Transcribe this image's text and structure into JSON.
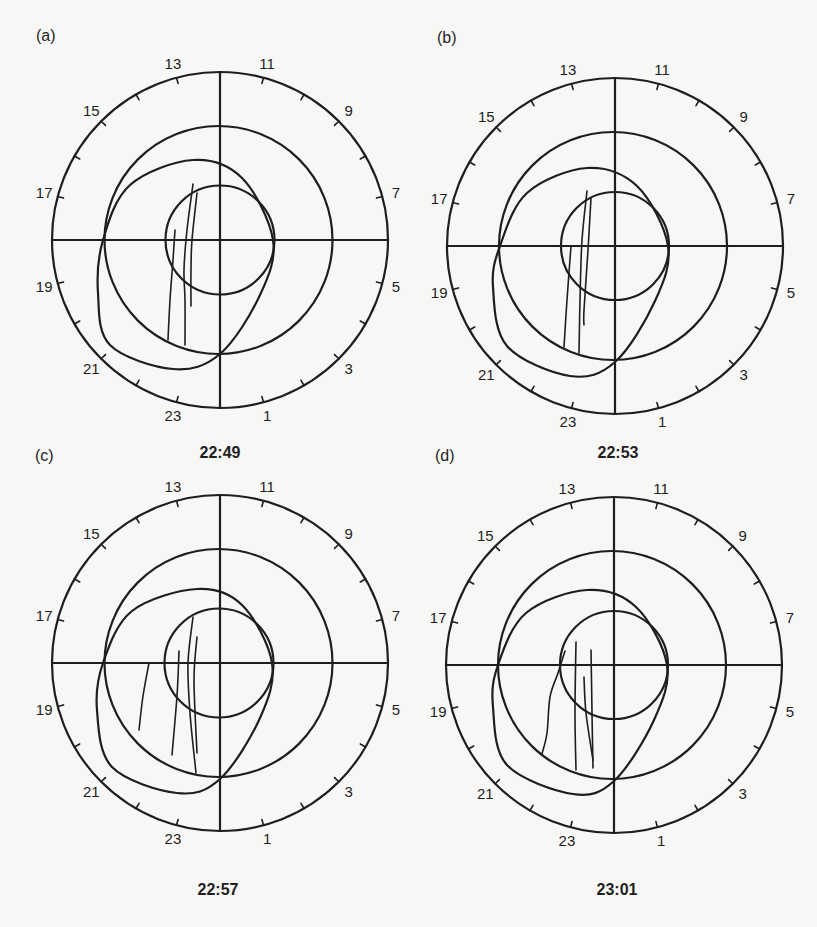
{
  "figure": {
    "hour_labels": [
      "1",
      "3",
      "5",
      "7",
      "9",
      "11",
      "13",
      "15",
      "17",
      "19",
      "21",
      "23"
    ],
    "hours_per_tick": 1,
    "top_hour": 12,
    "outer_radius": 168,
    "line_color": "#1e1e1e",
    "background_color": "#f7f7f5",
    "panels": [
      {
        "id": "a",
        "letter": "(a)",
        "time": "22:49",
        "center": [
          220,
          240
        ],
        "letter_pos": [
          36,
          41
        ],
        "time_pos": [
          220,
          458
        ],
        "middle_circle": {
          "cx": -1.5,
          "cy": 0,
          "r": 114
        },
        "inner_circle": {
          "cx": 0,
          "cy": 0,
          "r": 54.5
        },
        "oval": [
          [
            -117,
            0
          ],
          [
            -90,
            -55
          ],
          [
            -27,
            -80
          ],
          [
            22,
            -62
          ],
          [
            53,
            0
          ],
          [
            40,
            55
          ],
          [
            0,
            114
          ],
          [
            -47,
            129
          ],
          [
            -110,
            105
          ],
          [
            -122,
            53
          ]
        ],
        "arcs": [
          [
            [
              -45,
              -10
            ],
            [
              -47,
              20
            ],
            [
              -50,
              60
            ],
            [
              -52,
              100
            ]
          ],
          [
            [
              -27,
              -56
            ],
            [
              -33,
              -10
            ],
            [
              -36,
              30
            ],
            [
              -35,
              60
            ],
            [
              -35,
              105
            ]
          ],
          [
            [
              -23,
              -47
            ],
            [
              -28,
              0
            ],
            [
              -29,
              30
            ],
            [
              -29,
              66
            ]
          ]
        ]
      },
      {
        "id": "b",
        "letter": "(b)",
        "time": "22:53",
        "center": [
          615,
          246
        ],
        "letter_pos": [
          437,
          43
        ],
        "time_pos": [
          618,
          458
        ],
        "middle_circle": {
          "cx": -2,
          "cy": 0,
          "r": 114
        },
        "inner_circle": {
          "cx": 0,
          "cy": 0,
          "r": 54
        },
        "oval": [
          [
            -115,
            0
          ],
          [
            -88,
            -53
          ],
          [
            -28,
            -78
          ],
          [
            22,
            -60
          ],
          [
            53,
            0
          ],
          [
            40,
            55
          ],
          [
            0,
            116
          ],
          [
            -45,
            130
          ],
          [
            -108,
            100
          ],
          [
            -122,
            41
          ]
        ],
        "arcs": [
          [
            [
              -44,
              0
            ],
            [
              -48,
              54
            ],
            [
              -51,
              101
            ]
          ],
          [
            [
              -28,
              -55
            ],
            [
              -33,
              -6
            ],
            [
              -35,
              54
            ],
            [
              -36,
              107
            ]
          ],
          [
            [
              -24,
              -48
            ],
            [
              -27,
              4
            ],
            [
              -31,
              64
            ],
            [
              -31,
              79
            ]
          ]
        ]
      },
      {
        "id": "c",
        "letter": "(c)",
        "time": "22:57",
        "center": [
          220,
          663
        ],
        "letter_pos": [
          35,
          461
        ],
        "time_pos": [
          218,
          895
        ],
        "middle_circle": {
          "cx": -1.5,
          "cy": 0,
          "r": 114
        },
        "inner_circle": {
          "cx": -1,
          "cy": 0,
          "r": 54.5
        },
        "oval": [
          [
            -117,
            0
          ],
          [
            -88,
            -52
          ],
          [
            -23,
            -74
          ],
          [
            22,
            -58
          ],
          [
            52,
            0
          ],
          [
            40,
            55
          ],
          [
            0,
            116
          ],
          [
            -43,
            130
          ],
          [
            -108,
            104
          ],
          [
            -123,
            47
          ]
        ],
        "arcs": [
          [
            [
              -71,
              0
            ],
            [
              -77,
              33
            ],
            [
              -81,
              67
            ]
          ],
          [
            [
              -41,
              -12
            ],
            [
              -43,
              33
            ],
            [
              -48,
              92
            ]
          ],
          [
            [
              -27,
              -46
            ],
            [
              -32,
              0
            ],
            [
              -30,
              50
            ],
            [
              -24,
              110
            ]
          ],
          [
            [
              -23,
              -26
            ],
            [
              -26,
              17
            ],
            [
              -23,
              90
            ]
          ]
        ]
      },
      {
        "id": "d",
        "letter": "(d)",
        "time": "23:01",
        "center": [
          614,
          665
        ],
        "letter_pos": [
          435,
          461
        ],
        "time_pos": [
          617,
          895
        ],
        "middle_circle": {
          "cx": -2,
          "cy": 0,
          "r": 114
        },
        "inner_circle": {
          "cx": 0,
          "cy": 0,
          "r": 54
        },
        "oval": [
          [
            -116,
            0
          ],
          [
            -88,
            -52
          ],
          [
            -27,
            -75
          ],
          [
            22,
            -58
          ],
          [
            53,
            0
          ],
          [
            40,
            55
          ],
          [
            0,
            116
          ],
          [
            -41,
            129
          ],
          [
            -107,
            100
          ],
          [
            -121,
            42
          ]
        ],
        "arcs": [
          [
            [
              -49,
              -14
            ],
            [
              -56,
              8
            ],
            [
              -64,
              32
            ],
            [
              -67,
              68
            ],
            [
              -72,
              89
            ]
          ],
          [
            [
              -38,
              -23
            ],
            [
              -39,
              48
            ],
            [
              -38,
              105
            ]
          ],
          [
            [
              -23,
              -15
            ],
            [
              -22,
              48
            ],
            [
              -21,
              103
            ]
          ],
          [
            [
              -30,
              12
            ],
            [
              -28,
              48
            ],
            [
              -21,
              95
            ]
          ]
        ]
      }
    ]
  }
}
